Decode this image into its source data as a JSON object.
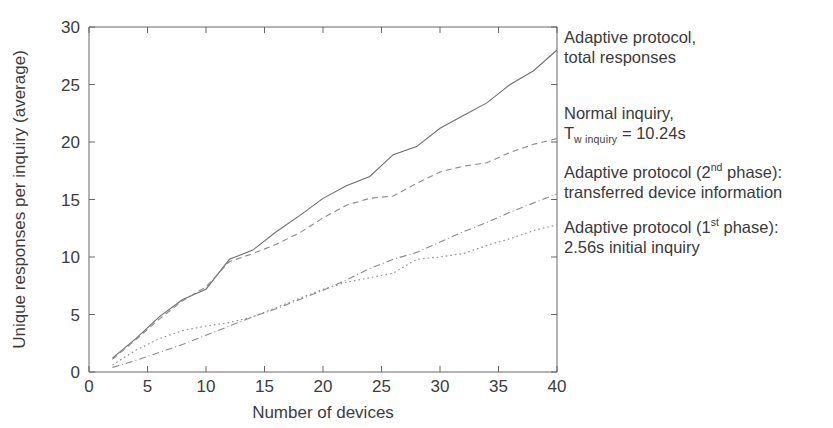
{
  "figure": {
    "background": "#ffffff",
    "line_color": "#7b7b7b",
    "text_color": "#3a3a3a"
  },
  "axes": {
    "xlabel": "Number of devices",
    "ylabel": "Unique responses per inquiry (average)",
    "x_ticks": [
      "0",
      "5",
      "10",
      "15",
      "20",
      "25",
      "30",
      "35",
      "40"
    ],
    "y_ticks": [
      "0",
      "5",
      "10",
      "15",
      "20",
      "25",
      "30"
    ]
  },
  "annotations": {
    "series1": {
      "line1": "Adaptive protocol,",
      "line2": "total responses"
    },
    "series2": {
      "line1": "Normal inquiry,",
      "sym": "T",
      "sub": "w inquiry",
      "eq": " = 10.24s"
    },
    "series3": {
      "line1_a": "Adaptive protocol (2",
      "line1_sup": "nd",
      "line1_b": " phase):",
      "line2": "transferred device information"
    },
    "series4": {
      "line1_a": "Adaptive protocol (1",
      "line1_sup": "st",
      "line1_b": " phase):",
      "line2": "2.56s initial inquiry"
    }
  },
  "chart_data": {
    "type": "line",
    "title": "",
    "xlabel": "Number of devices",
    "ylabel": "Unique responses per inquiry (average)",
    "xlim": [
      0,
      40
    ],
    "ylim": [
      0,
      30
    ],
    "xticks": [
      0,
      5,
      10,
      15,
      20,
      25,
      30,
      35,
      40
    ],
    "yticks": [
      0,
      5,
      10,
      15,
      20,
      25,
      30
    ],
    "grid": false,
    "legend_position": "right-outside-labels",
    "x": [
      2,
      4,
      6,
      8,
      10,
      12,
      14,
      16,
      18,
      20,
      22,
      24,
      26,
      28,
      30,
      32,
      34,
      36,
      38,
      40
    ],
    "series": [
      {
        "name": "Adaptive protocol, total responses",
        "style": "solid",
        "values": [
          1.2,
          2.9,
          4.8,
          6.3,
          7.2,
          9.8,
          10.6,
          12.2,
          13.6,
          15.1,
          16.2,
          17.0,
          18.9,
          19.6,
          21.2,
          22.3,
          23.4,
          25.0,
          26.2,
          28.0
        ]
      },
      {
        "name": "Normal inquiry, Tw inquiry = 10.24s",
        "style": "dashed",
        "values": [
          1.1,
          2.8,
          4.6,
          6.2,
          7.4,
          9.6,
          10.3,
          11.1,
          12.1,
          13.4,
          14.5,
          15.1,
          15.3,
          16.4,
          17.4,
          17.9,
          18.2,
          19.1,
          19.8,
          20.3
        ]
      },
      {
        "name": "Adaptive protocol (2nd phase): transferred device information",
        "style": "dashdot",
        "values": [
          0.4,
          1.0,
          1.7,
          2.4,
          3.2,
          4.0,
          4.8,
          5.5,
          6.3,
          7.1,
          8.0,
          9.0,
          9.8,
          10.4,
          11.3,
          12.2,
          13.0,
          13.9,
          14.7,
          15.5
        ]
      },
      {
        "name": "Adaptive protocol (1st phase): 2.56s initial inquiry",
        "style": "dotted",
        "values": [
          0.6,
          1.9,
          2.9,
          3.6,
          4.0,
          4.3,
          4.8,
          5.6,
          6.4,
          7.2,
          7.8,
          8.2,
          8.6,
          9.8,
          10.0,
          10.3,
          11.0,
          11.6,
          12.3,
          12.8
        ]
      }
    ]
  }
}
